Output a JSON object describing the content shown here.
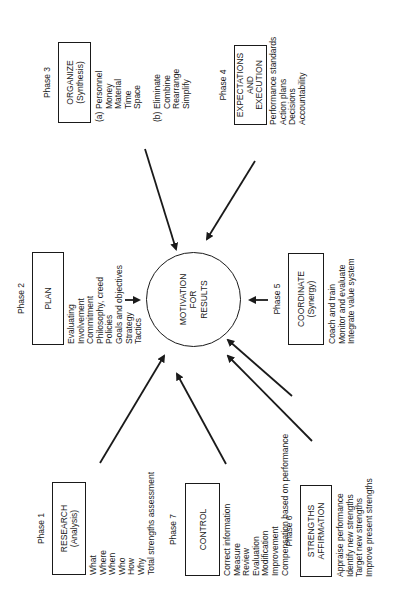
{
  "diagram": {
    "center": {
      "lines": [
        "MOTIVATION",
        "FOR",
        "RESULTS"
      ]
    },
    "phases": [
      {
        "phase": "Phase 1",
        "title": [
          "RESEARCH",
          "(Analysis)"
        ],
        "items": [
          "What",
          "Where",
          "When",
          "Who",
          "How",
          "Why",
          "Total strengths assessment"
        ]
      },
      {
        "phase": "Phase 2",
        "title": [
          "PLAN"
        ],
        "items": [
          "Evaluating",
          "Involvement",
          "Commitment",
          "Philosophy, creed",
          "Policies",
          "Goals and objectives",
          "Strategy",
          "Tactics"
        ]
      },
      {
        "phase": "Phase 3",
        "title": [
          "ORGANIZE",
          "(Synthesis)"
        ],
        "groups": [
          {
            "tag": "(a)",
            "items": [
              "Personnel",
              "Money",
              "Material",
              "Time",
              "Space"
            ]
          },
          {
            "tag": "(b)",
            "items": [
              "Eliminate",
              "Combine",
              "Rearrange",
              "Simplify"
            ]
          }
        ]
      },
      {
        "phase": "Phase 4",
        "title": [
          "EXPECTATIONS",
          "AND",
          "EXECUTION"
        ],
        "items": [
          "Performance standards",
          "Action plans",
          "Decisions",
          "Accountability"
        ]
      },
      {
        "phase": "Phase 5",
        "title": [
          "COORDINATE",
          "(Synergy)"
        ],
        "items": [
          "Coach and train",
          "Monitor and evaluate",
          "Integrate value system"
        ]
      },
      {
        "phase": "Phase 6",
        "title": [
          "STRENGTHS",
          "AFFIRMATION"
        ],
        "items": [
          "Appraise performance",
          "Identify new strengths",
          "Target new strengths",
          "Improve present strengths"
        ]
      },
      {
        "phase": "Phase 7",
        "title": [
          "CONTROL"
        ],
        "items": [
          "Correct information",
          "Measure",
          "Review",
          "Evaluation",
          "Modification",
          "Improvement",
          "Compensation based on performance"
        ]
      }
    ]
  }
}
